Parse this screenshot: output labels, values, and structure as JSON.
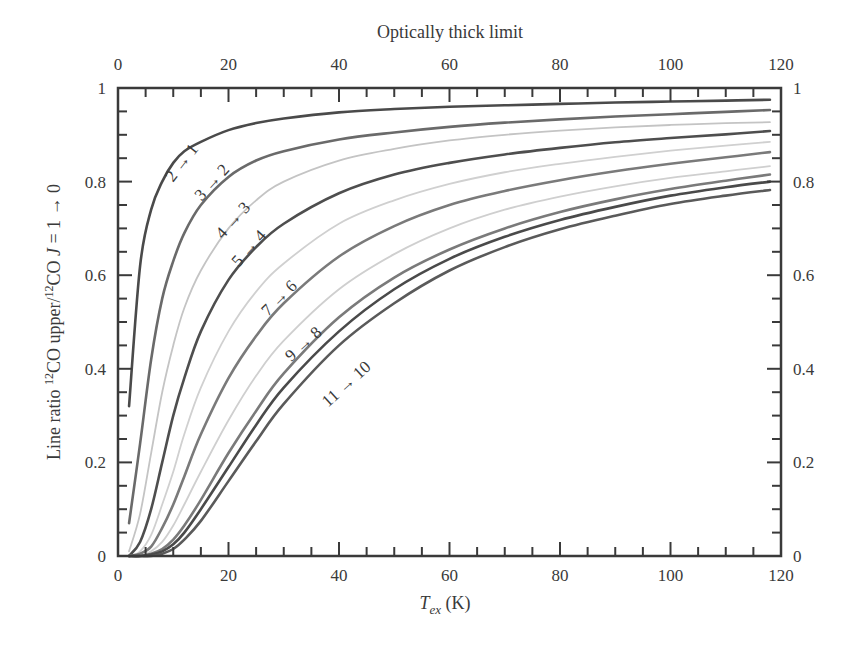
{
  "chart_data": {
    "type": "line",
    "title": "Optically thick limit",
    "xlabel": "T_ex (K)",
    "xlabel_main": "T",
    "xlabel_sub": "ex",
    "xlabel_unit": "(K)",
    "ylabel": "Line ratio 12CO upper/12CO J = 1 → 0",
    "xlim": [
      0,
      120
    ],
    "ylim": [
      0,
      1
    ],
    "x_ticks": [
      "0",
      "20",
      "40",
      "60",
      "80",
      "100",
      "120"
    ],
    "y_ticks_left": [
      "0",
      "0.2",
      "0.4",
      "0.6",
      "0.8",
      "1"
    ],
    "y_ticks_right": [
      "0",
      "0.2",
      "0.4",
      "0.6",
      "0.8",
      "1"
    ],
    "grid": false,
    "legend": "inline curve labels",
    "x": [
      2,
      4,
      6,
      8,
      10,
      12,
      15,
      20,
      25,
      30,
      40,
      50,
      60,
      70,
      80,
      90,
      100,
      110,
      118
    ],
    "series": [
      {
        "name": "2 → 1",
        "labeled": true,
        "color": "#4a4a4a",
        "values": [
          0.32,
          0.62,
          0.74,
          0.8,
          0.84,
          0.865,
          0.885,
          0.91,
          0.925,
          0.935,
          0.948,
          0.955,
          0.96,
          0.963,
          0.966,
          0.969,
          0.971,
          0.973,
          0.975
        ]
      },
      {
        "name": "3 → 2",
        "labeled": true,
        "color": "#6a6a6a",
        "values": [
          0.07,
          0.24,
          0.42,
          0.55,
          0.63,
          0.69,
          0.75,
          0.81,
          0.845,
          0.865,
          0.89,
          0.905,
          0.917,
          0.926,
          0.933,
          0.939,
          0.944,
          0.949,
          0.953
        ]
      },
      {
        "name": "4 → 3",
        "labeled": true,
        "color": "#c4c4c4",
        "values": [
          0.01,
          0.09,
          0.22,
          0.35,
          0.45,
          0.53,
          0.61,
          0.7,
          0.76,
          0.8,
          0.845,
          0.87,
          0.888,
          0.9,
          0.909,
          0.916,
          0.921,
          0.925,
          0.927
        ]
      },
      {
        "name": "5 → 4",
        "labeled": true,
        "color": "#4e4e4e",
        "values": [
          0.0,
          0.03,
          0.1,
          0.2,
          0.3,
          0.38,
          0.48,
          0.59,
          0.66,
          0.71,
          0.775,
          0.815,
          0.84,
          0.858,
          0.872,
          0.884,
          0.893,
          0.901,
          0.908
        ]
      },
      {
        "name": "6 → 5",
        "labeled": false,
        "color": "#d0d0d0",
        "values": [
          0.0,
          0.01,
          0.045,
          0.11,
          0.18,
          0.26,
          0.36,
          0.48,
          0.565,
          0.625,
          0.71,
          0.76,
          0.795,
          0.82,
          0.838,
          0.853,
          0.866,
          0.877,
          0.885
        ]
      },
      {
        "name": "7 → 6",
        "labeled": true,
        "color": "#7a7a7a",
        "values": [
          0.0,
          0.005,
          0.02,
          0.06,
          0.11,
          0.17,
          0.26,
          0.38,
          0.47,
          0.54,
          0.64,
          0.705,
          0.75,
          0.78,
          0.803,
          0.822,
          0.838,
          0.852,
          0.863
        ]
      },
      {
        "name": "8 → 7",
        "labeled": false,
        "color": "#cfcfcf",
        "values": [
          0.0,
          0.0,
          0.01,
          0.03,
          0.065,
          0.11,
          0.18,
          0.29,
          0.385,
          0.46,
          0.57,
          0.645,
          0.7,
          0.74,
          0.768,
          0.79,
          0.808,
          0.822,
          0.833
        ]
      },
      {
        "name": "9 → 8",
        "labeled": true,
        "color": "#7a7a7a",
        "values": [
          0.0,
          0.0,
          0.005,
          0.015,
          0.035,
          0.065,
          0.12,
          0.22,
          0.31,
          0.39,
          0.51,
          0.595,
          0.655,
          0.7,
          0.735,
          0.762,
          0.784,
          0.802,
          0.815
        ]
      },
      {
        "name": "10 → 9",
        "labeled": false,
        "color": "#4a4a4a",
        "values": [
          0.0,
          0.0,
          0.003,
          0.01,
          0.025,
          0.05,
          0.1,
          0.19,
          0.28,
          0.36,
          0.48,
          0.57,
          0.635,
          0.682,
          0.718,
          0.746,
          0.77,
          0.788,
          0.8
        ]
      },
      {
        "name": "11 → 10",
        "labeled": true,
        "color": "#5a5a5a",
        "values": [
          0.0,
          0.0,
          0.0,
          0.005,
          0.015,
          0.035,
          0.075,
          0.16,
          0.245,
          0.325,
          0.45,
          0.54,
          0.61,
          0.66,
          0.698,
          0.727,
          0.752,
          0.77,
          0.782
        ]
      }
    ]
  },
  "labels": {
    "top_title": "Optically thick limit",
    "y_axis_label": "Line ratio ¹²CO upper/¹²CO J = 1 → 0",
    "x_axis_label_main": "T",
    "x_axis_label_sub": "ex",
    "x_axis_label_unit": " (K)"
  }
}
